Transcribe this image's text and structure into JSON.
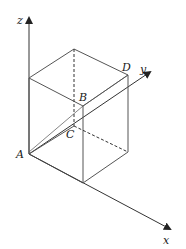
{
  "diagram": {
    "type": "3d-cube-axes",
    "colors": {
      "line": "#555555",
      "axis": "#333333",
      "label": "#1a1a1a",
      "background": "#ffffff"
    },
    "axes": {
      "z": {
        "label": "z"
      },
      "y": {
        "label": "y"
      },
      "x": {
        "label": "x"
      }
    },
    "points": {
      "A": {
        "label": "A"
      },
      "B": {
        "label": "B"
      },
      "C": {
        "label": "C"
      },
      "D": {
        "label": "D"
      }
    }
  }
}
